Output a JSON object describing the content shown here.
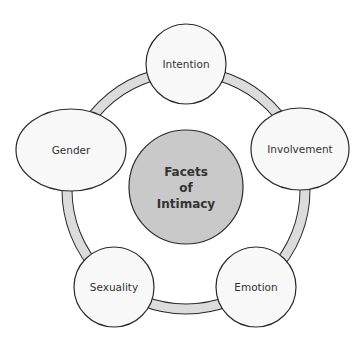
{
  "diagram": {
    "type": "cycle",
    "colors": {
      "background": "#ffffff",
      "ring_fill": "#dcdcdc",
      "outline": "#2a2a2a",
      "node_fill": "#f8f8f8",
      "center_fill": "#c9c9c9",
      "text": "#333333"
    },
    "center": {
      "lines": [
        "Facets",
        "of",
        "Intimacy"
      ]
    },
    "nodes": [
      {
        "id": "intention",
        "label": "Intention"
      },
      {
        "id": "involvement",
        "label": "Involvement"
      },
      {
        "id": "emotion",
        "label": "Emotion"
      },
      {
        "id": "sexuality",
        "label": "Sexuality"
      },
      {
        "id": "gender",
        "label": "Gender"
      }
    ]
  }
}
